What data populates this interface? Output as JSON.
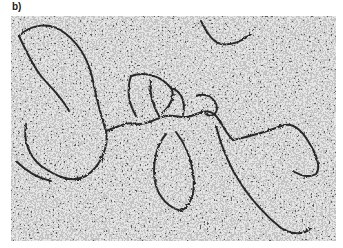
{
  "figure": {
    "panel_label": "b)",
    "image": {
      "type": "electron-micrograph",
      "subject": "dna-strands",
      "description": "Grayscale speckled micrograph with dark branching filamentous strands"
    }
  },
  "colors": {
    "background": "#ffffff",
    "speckle_light": "#c8c8c8",
    "speckle_dark": "#1e1e1e",
    "strand": "#141414",
    "label": "#1a1a1a"
  }
}
